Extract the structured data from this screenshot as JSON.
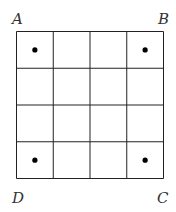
{
  "labels": {
    "A": "A",
    "B": "B",
    "C": "C",
    "D": "D"
  },
  "grid": {
    "rows": 4,
    "cols": 4,
    "left": 16.5,
    "top": 31.5,
    "cell": 36.75
  },
  "dots": [
    [
      0,
      0
    ],
    [
      0,
      3
    ],
    [
      3,
      0
    ],
    [
      3,
      3
    ]
  ],
  "colors": {
    "line": "#222222",
    "dot": "#000000"
  }
}
